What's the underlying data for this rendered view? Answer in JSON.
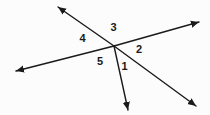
{
  "canvas": {
    "width": 210,
    "height": 115,
    "background": "#fcfcfc"
  },
  "diagram": {
    "type": "angle-diagram",
    "stroke_color": "#1a1a1a",
    "label_color": "#1a1a1a",
    "vertex": {
      "x": 114,
      "y": 46
    },
    "rays": [
      {
        "name": "ray-upper-left",
        "x2": 58,
        "y2": 7
      },
      {
        "name": "ray-upper-right",
        "x2": 199,
        "y2": 22
      },
      {
        "name": "ray-lower-left",
        "x2": 16,
        "y2": 71
      },
      {
        "name": "ray-lower-right",
        "x2": 196,
        "y2": 106
      },
      {
        "name": "ray-down",
        "x2": 128,
        "y2": 110
      }
    ],
    "angle_labels": [
      {
        "text": "1",
        "x": 124.5,
        "y": 66
      },
      {
        "text": "2",
        "x": 139,
        "y": 48.5
      },
      {
        "text": "3",
        "x": 113.5,
        "y": 26.5
      },
      {
        "text": "4",
        "x": 82.5,
        "y": 37.5
      },
      {
        "text": "5",
        "x": 100,
        "y": 61
      }
    ]
  }
}
